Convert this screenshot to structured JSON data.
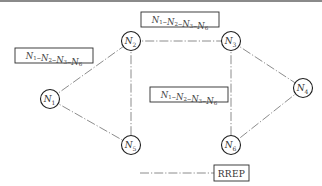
{
  "diagram": {
    "nodes": [
      {
        "id": "N1",
        "base": "N",
        "sub": "1",
        "x": 50,
        "y": 99
      },
      {
        "id": "N2",
        "base": "N",
        "sub": "2",
        "x": 131,
        "y": 41
      },
      {
        "id": "N3",
        "base": "N",
        "sub": "3",
        "x": 231,
        "y": 41
      },
      {
        "id": "N4",
        "base": "N",
        "sub": "4",
        "x": 303,
        "y": 88
      },
      {
        "id": "N5",
        "base": "N",
        "sub": "5",
        "x": 131,
        "y": 145
      },
      {
        "id": "N6",
        "base": "N",
        "sub": "6",
        "x": 231,
        "y": 145
      }
    ],
    "edges": [
      {
        "from": "N1",
        "to": "N2"
      },
      {
        "from": "N1",
        "to": "N5"
      },
      {
        "from": "N2",
        "to": "N3"
      },
      {
        "from": "N2",
        "to": "N5"
      },
      {
        "from": "N3",
        "to": "N4"
      },
      {
        "from": "N3",
        "to": "N6"
      },
      {
        "from": "N4",
        "to": "N6"
      }
    ],
    "path_labels": [
      {
        "id": "path-top",
        "text": "N1–N2–N3–N6",
        "parts": [
          {
            "base": "N",
            "sub": "1"
          },
          {
            "base": "N",
            "sub": "2"
          },
          {
            "base": "N",
            "sub": "3"
          },
          {
            "base": "N",
            "sub": "6"
          }
        ],
        "x": 141,
        "y": 12,
        "w": 78,
        "h": 15
      },
      {
        "id": "path-left",
        "text": "N1–N2–N3–N6",
        "parts": [
          {
            "base": "N",
            "sub": "1"
          },
          {
            "base": "N",
            "sub": "2"
          },
          {
            "base": "N",
            "sub": "3"
          },
          {
            "base": "N",
            "sub": "6"
          }
        ],
        "x": 15,
        "y": 48,
        "w": 78,
        "h": 15
      },
      {
        "id": "path-middle",
        "text": "N1–N2–N3–N6",
        "parts": [
          {
            "base": "N",
            "sub": "1"
          },
          {
            "base": "N",
            "sub": "2"
          },
          {
            "base": "N",
            "sub": "3"
          },
          {
            "base": "N",
            "sub": "6"
          }
        ],
        "x": 150,
        "y": 87,
        "w": 78,
        "h": 15
      }
    ],
    "legend": {
      "label": "RREP",
      "line_x1": 140,
      "line_x2": 214,
      "y": 173,
      "box": {
        "x": 214,
        "y": 165,
        "w": 35,
        "h": 16
      }
    }
  }
}
